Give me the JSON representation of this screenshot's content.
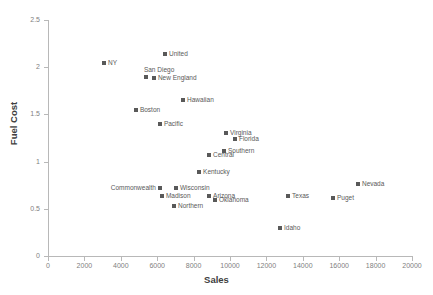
{
  "chart_data": {
    "type": "scatter",
    "title": "",
    "xlabel": "Sales",
    "ylabel": "Fuel Cost",
    "xlim": [
      0,
      20000
    ],
    "ylim": [
      0,
      2.5
    ],
    "grid": false,
    "legend": "none",
    "xticks": [
      "0",
      "2000",
      "4000",
      "6000",
      "8000",
      "10000",
      "12000",
      "14000",
      "16000",
      "18000",
      "20000"
    ],
    "yticks": [
      "0",
      "0.5",
      "1",
      "1.5",
      "2",
      "2.5"
    ],
    "points": [
      {
        "label": "NY",
        "x": 3080,
        "y": 2.04,
        "label_pos": "right"
      },
      {
        "label": "United",
        "x": 6430,
        "y": 2.14,
        "label_pos": "right"
      },
      {
        "label": "San Diego",
        "x": 5380,
        "y": 1.9,
        "label_pos": "above"
      },
      {
        "label": "New England",
        "x": 5820,
        "y": 1.89,
        "label_pos": "right"
      },
      {
        "label": "Hawaiian",
        "x": 7420,
        "y": 1.65,
        "label_pos": "right"
      },
      {
        "label": "Boston",
        "x": 4830,
        "y": 1.55,
        "label_pos": "right"
      },
      {
        "label": "Pacific",
        "x": 6150,
        "y": 1.4,
        "label_pos": "right"
      },
      {
        "label": "Virginia",
        "x": 9780,
        "y": 1.3,
        "label_pos": "right"
      },
      {
        "label": "Florida",
        "x": 10270,
        "y": 1.24,
        "label_pos": "right"
      },
      {
        "label": "Southern",
        "x": 9670,
        "y": 1.11,
        "label_pos": "right"
      },
      {
        "label": "Central",
        "x": 8850,
        "y": 1.07,
        "label_pos": "right"
      },
      {
        "label": "Kentucky",
        "x": 8300,
        "y": 0.89,
        "label_pos": "right"
      },
      {
        "label": "Commonwealth",
        "x": 6150,
        "y": 0.72,
        "label_pos": "left"
      },
      {
        "label": "Wisconsin",
        "x": 7030,
        "y": 0.72,
        "label_pos": "right"
      },
      {
        "label": "Madison",
        "x": 6260,
        "y": 0.64,
        "label_pos": "right"
      },
      {
        "label": "Arizona",
        "x": 8850,
        "y": 0.64,
        "label_pos": "right"
      },
      {
        "label": "Oklahoma",
        "x": 9180,
        "y": 0.59,
        "label_pos": "right"
      },
      {
        "label": "Northern",
        "x": 6920,
        "y": 0.53,
        "label_pos": "right"
      },
      {
        "label": "Texas",
        "x": 13190,
        "y": 0.64,
        "label_pos": "right"
      },
      {
        "label": "Puget",
        "x": 15660,
        "y": 0.61,
        "label_pos": "right"
      },
      {
        "label": "Nevada",
        "x": 17030,
        "y": 0.76,
        "label_pos": "right"
      },
      {
        "label": "Idaho",
        "x": 12750,
        "y": 0.3,
        "label_pos": "right"
      }
    ],
    "colors": {
      "marker": "#595959",
      "axis": "#b8b8b8",
      "tick_text": "#808080",
      "axis_title": "#404040",
      "background": "#ffffff"
    }
  }
}
